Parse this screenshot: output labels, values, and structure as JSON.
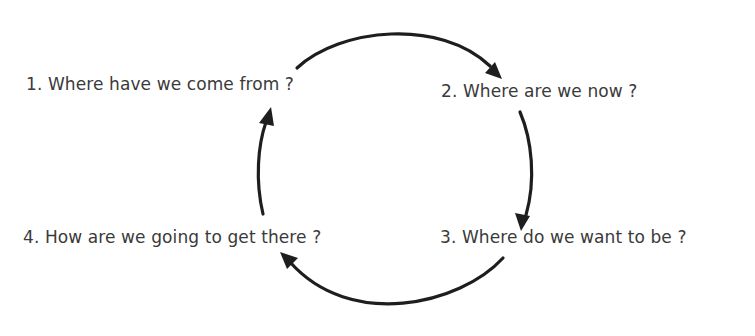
{
  "diagram": {
    "type": "cycle",
    "stages": [
      {
        "id": 1,
        "label": "1. Where have we come from ?"
      },
      {
        "id": 2,
        "label": "2. Where are we now ?"
      },
      {
        "id": 3,
        "label": "3. Where do we want to be ?"
      },
      {
        "id": 4,
        "label": "4. How are we going to get there ?"
      }
    ],
    "flow": [
      {
        "from": 1,
        "to": 2,
        "icon": "arrow-curved-right-icon"
      },
      {
        "from": 2,
        "to": 3,
        "icon": "arrow-curved-down-icon"
      },
      {
        "from": 3,
        "to": 4,
        "icon": "arrow-curved-left-icon"
      },
      {
        "from": 4,
        "to": 1,
        "icon": "arrow-curved-up-icon"
      }
    ],
    "colors": {
      "text": "#3a3a3a",
      "arrow": "#1e1e1e",
      "background": "#ffffff"
    }
  }
}
